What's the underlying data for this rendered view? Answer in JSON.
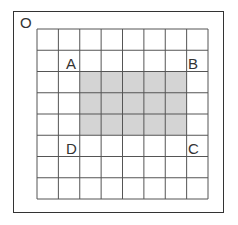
{
  "diagram": {
    "origin_label": "O",
    "grid": {
      "columns": 8,
      "rows": 8,
      "left": 37,
      "top": 29,
      "cell_width": 21.375,
      "cell_height": 21.25,
      "line_color": "#555555"
    },
    "shaded_region": {
      "col_start": 2,
      "col_end": 7,
      "row_start": 2,
      "row_end": 5,
      "fill": "#d4d4d4"
    },
    "points": [
      {
        "label": "A",
        "x": 66,
        "y": 56
      },
      {
        "label": "B",
        "x": 188,
        "y": 56
      },
      {
        "label": "C",
        "x": 188,
        "y": 141
      },
      {
        "label": "D",
        "x": 66,
        "y": 141
      }
    ],
    "frame_color": "#333333"
  }
}
